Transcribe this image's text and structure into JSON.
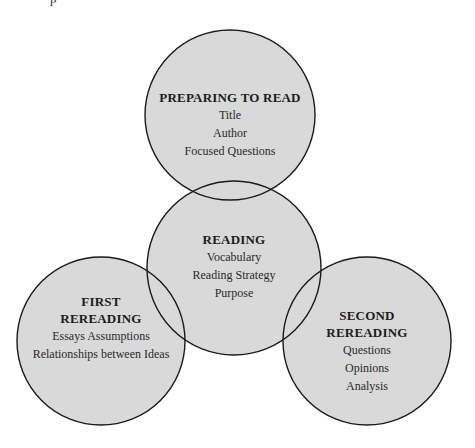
{
  "top_fragment": "p",
  "diagram": {
    "fill_color": "#d9d9d9",
    "stroke_color": "#1a1a1a",
    "nodes": [
      {
        "id": "preparing-to-read",
        "title_lines": [
          "PREPARING TO READ"
        ],
        "items": [
          "Title",
          "Author",
          "Focused Questions"
        ],
        "cx": 230,
        "cy": 115,
        "r": 85
      },
      {
        "id": "reading",
        "title_lines": [
          "READING"
        ],
        "items": [
          "Vocabulary",
          "Reading Strategy",
          "Purpose"
        ],
        "cx": 234,
        "cy": 268,
        "r": 87
      },
      {
        "id": "first-rereading",
        "title_lines": [
          "FIRST",
          "REREADING"
        ],
        "items": [
          "Essays Assumptions",
          "Relationships between Ideas"
        ],
        "cx": 101,
        "cy": 341,
        "r": 84
      },
      {
        "id": "second-rereading",
        "title_lines": [
          "SECOND",
          "REREADING"
        ],
        "items": [
          "Questions",
          "Opinions",
          "Analysis"
        ],
        "cx": 367,
        "cy": 341,
        "r": 84
      }
    ]
  }
}
